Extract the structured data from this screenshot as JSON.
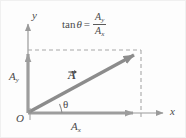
{
  "figure": {
    "type": "physics-vector-diagram",
    "colors": {
      "axis": "#9a9a9a",
      "vector": "#8c8c8c",
      "dashed": "#a8a8a8",
      "text": "#4a4a4a",
      "background": "#fdfdfd"
    },
    "axes": {
      "x_label": "x",
      "y_label": "y",
      "origin_label": "O"
    },
    "labels": {
      "vector": "A",
      "vector_has_arrow_overbar": true,
      "angle": "θ",
      "component_x_base": "A",
      "component_x_sub": "x",
      "component_y_base": "A",
      "component_y_sub": "y"
    },
    "formula": {
      "tan": "tan",
      "theta": "θ",
      "equals": "=",
      "numerator_base": "A",
      "numerator_sub": "y",
      "denominator_base": "A",
      "denominator_sub": "x",
      "plain_text": "tan θ = A_y / A_x"
    },
    "geometry": {
      "origin_px": [
        28,
        113
      ],
      "vector_tip_px": [
        140,
        52
      ],
      "x_axis_end_px": [
        166,
        113
      ],
      "y_axis_top_px": [
        28,
        22
      ]
    }
  }
}
